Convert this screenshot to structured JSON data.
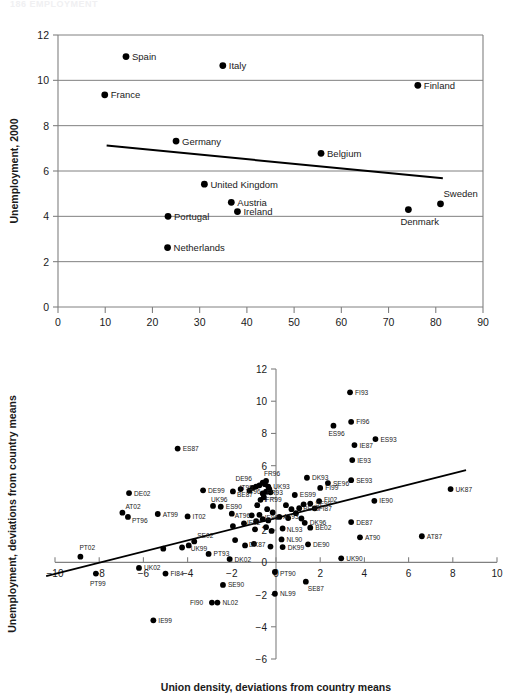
{
  "page": {
    "header_text": "186   EMPLOYMENT"
  },
  "chart_data": [
    {
      "id": "top",
      "type": "scatter",
      "title": "",
      "xlabel": "Union density, 2000",
      "ylabel": "Unemployment, 2000",
      "xlim": [
        0,
        90
      ],
      "ylim": [
        0,
        12
      ],
      "xticks": [
        0,
        10,
        20,
        30,
        40,
        50,
        60,
        70,
        80,
        90
      ],
      "yticks": [
        0,
        2,
        4,
        6,
        8,
        10,
        12
      ],
      "grid": "horizontal",
      "legend": "none",
      "trendline": {
        "x1": 10.3,
        "y1": 7.12,
        "x2": 81.5,
        "y2": 5.68
      },
      "points": [
        {
          "label": "Spain",
          "x": 14.4,
          "y": 11.05,
          "lx": 6,
          "ly": 3.5
        },
        {
          "label": "Italy",
          "x": 34.9,
          "y": 10.65,
          "lx": 6,
          "ly": 3.5
        },
        {
          "label": "Finland",
          "x": 76.2,
          "y": 9.78,
          "lx": 6,
          "ly": 3.5
        },
        {
          "label": "France",
          "x": 9.9,
          "y": 9.36,
          "lx": 6,
          "ly": 3.5
        },
        {
          "label": "Germany",
          "x": 25.0,
          "y": 7.32,
          "lx": 6,
          "ly": 3.5
        },
        {
          "label": "Belgium",
          "x": 55.7,
          "y": 6.78,
          "lx": 6,
          "ly": 3.5
        },
        {
          "label": "United Kingdom",
          "x": 31.0,
          "y": 5.42,
          "lx": 6,
          "ly": 3.5
        },
        {
          "label": "Austria",
          "x": 36.7,
          "y": 4.62,
          "lx": 6,
          "ly": 3.5
        },
        {
          "label": "Sweden",
          "x": 81.0,
          "y": 4.55,
          "lx": 3,
          "ly": -7
        },
        {
          "label": "Ireland",
          "x": 38.0,
          "y": 4.21,
          "lx": 6,
          "ly": 3.5
        },
        {
          "label": "Denmark",
          "x": 74.2,
          "y": 4.3,
          "lx": -8,
          "ly": 15
        },
        {
          "label": "Portugal",
          "x": 23.3,
          "y": 4.0,
          "lx": 6,
          "ly": 3.5
        },
        {
          "label": "Netherlands",
          "x": 23.2,
          "y": 2.62,
          "lx": 6,
          "ly": 3.5
        }
      ]
    },
    {
      "id": "bottom",
      "type": "scatter",
      "title": "",
      "xlabel": "Union density, deviations from country means",
      "ylabel": "Unemployment, deviations from country means",
      "xlim": [
        -10,
        10
      ],
      "ylim": [
        -6,
        12
      ],
      "xticks": [
        -10,
        -8,
        -6,
        -4,
        -2,
        0,
        2,
        4,
        6,
        8,
        10
      ],
      "yticks": [
        -6,
        -4,
        -2,
        0,
        2,
        4,
        6,
        8,
        10,
        12
      ],
      "grid": "none",
      "legend": "none",
      "trendline": {
        "x1": -10.4,
        "y1": -0.85,
        "x2": 8.6,
        "y2": 5.72
      },
      "points": [
        {
          "label": "FI93",
          "x": 3.35,
          "y": 10.55,
          "lx": 5,
          "ly": 2.5
        },
        {
          "label": "FI96",
          "x": 3.4,
          "y": 8.72,
          "lx": 5,
          "ly": 2.5
        },
        {
          "label": "ES96",
          "x": 2.6,
          "y": 8.48,
          "lx": -5,
          "ly": 10
        },
        {
          "label": "ES93",
          "x": 4.5,
          "y": 7.65,
          "lx": 5,
          "ly": 2.5
        },
        {
          "label": "IE87",
          "x": 3.55,
          "y": 7.28,
          "lx": 5,
          "ly": 2.5
        },
        {
          "label": "ES87",
          "x": -4.45,
          "y": 7.06,
          "lx": 5,
          "ly": 2.5
        },
        {
          "label": "IE93",
          "x": 3.45,
          "y": 6.35,
          "lx": 5,
          "ly": 2.5
        },
        {
          "label": "DK93",
          "x": 1.4,
          "y": 5.25,
          "lx": 5,
          "ly": 2.5
        },
        {
          "label": "SE93",
          "x": 3.4,
          "y": 5.1,
          "lx": 5,
          "ly": 2.5
        },
        {
          "label": "SE96",
          "x": 2.35,
          "y": 4.92,
          "lx": 5,
          "ly": 2.5
        },
        {
          "label": "FR96",
          "x": -0.45,
          "y": 5.05,
          "lx": -2,
          "ly": -5
        },
        {
          "label": "DE96",
          "x": -0.75,
          "y": 4.78,
          "lx": -24,
          "ly": -4
        },
        {
          "label": "UK93",
          "x": -0.35,
          "y": 4.7,
          "lx": 5,
          "ly": 2.5
        },
        {
          "label": "FI99",
          "x": 2.0,
          "y": 4.62,
          "lx": 5,
          "ly": 2.5
        },
        {
          "label": "UK87",
          "x": 7.9,
          "y": 4.55,
          "lx": 5,
          "ly": 2.5
        },
        {
          "label": "IT99",
          "x": -1.6,
          "y": 4.55,
          "lx": -1,
          "ly": 1
        },
        {
          "label": "IT96",
          "x": -1.2,
          "y": 4.45,
          "lx": -2,
          "ly": 3
        },
        {
          "label": "DE99",
          "x": -3.3,
          "y": 4.47,
          "lx": 5,
          "ly": 2.5
        },
        {
          "label": "BE87",
          "x": -1.95,
          "y": 4.4,
          "lx": 4,
          "ly": 6
        },
        {
          "label": "FR93",
          "x": -0.6,
          "y": 4.28,
          "lx": 4,
          "ly": 2
        },
        {
          "label": "DE02",
          "x": -6.65,
          "y": 4.3,
          "lx": 5,
          "ly": 2.5
        },
        {
          "label": "ES99",
          "x": 0.85,
          "y": 4.18,
          "lx": 5,
          "ly": 2.5
        },
        {
          "label": "IE90",
          "x": 4.45,
          "y": 3.82,
          "lx": 5,
          "ly": 2.5
        },
        {
          "label": "FR99",
          "x": -0.7,
          "y": 3.88,
          "lx": 5,
          "ly": 2.5
        },
        {
          "label": "SE99",
          "x": 1.55,
          "y": 3.65,
          "lx": 5,
          "ly": 2.5
        },
        {
          "label": "FI02",
          "x": 1.95,
          "y": 3.8,
          "lx": 5,
          "ly": 1
        },
        {
          "label": "BE99",
          "x": 1.05,
          "y": 3.36,
          "lx": 4,
          "ly": 3
        },
        {
          "label": "FI87",
          "x": 1.75,
          "y": 3.35,
          "lx": 4,
          "ly": 3
        },
        {
          "label": "ES90",
          "x": -2.5,
          "y": 3.45,
          "lx": 5,
          "ly": 2.5
        },
        {
          "label": "UK96",
          "x": -2.85,
          "y": 3.5,
          "lx": -2,
          "ly": -4
        },
        {
          "label": "AT96",
          "x": -2.0,
          "y": 3.02,
          "lx": 3,
          "ly": 4
        },
        {
          "label": "AT02",
          "x": -6.95,
          "y": 3.08,
          "lx": 3,
          "ly": -4
        },
        {
          "label": "AT99",
          "x": -5.35,
          "y": 3.0,
          "lx": 5,
          "ly": 2.5
        },
        {
          "label": "PT96",
          "x": -6.7,
          "y": 2.82,
          "lx": 4,
          "ly": 6
        },
        {
          "label": "IT02",
          "x": -4.0,
          "y": 2.85,
          "lx": 5,
          "ly": 2.5
        },
        {
          "label": "AT93",
          "x": 0.15,
          "y": 2.82,
          "lx": 4,
          "ly": 2
        },
        {
          "label": "IE96",
          "x": -0.6,
          "y": 2.68,
          "lx": 2,
          "ly": 1
        },
        {
          "label": "DE87",
          "x": 3.4,
          "y": 2.5,
          "lx": 5,
          "ly": 2.5
        },
        {
          "label": "DK96",
          "x": 1.3,
          "y": 2.45,
          "lx": 5,
          "ly": 2.5
        },
        {
          "label": "BE02",
          "x": 1.55,
          "y": 2.15,
          "lx": 5,
          "ly": 2.5
        },
        {
          "label": "NL93",
          "x": 0.3,
          "y": 2.1,
          "lx": 4,
          "ly": 3
        },
        {
          "label": "IE02",
          "x": -1.45,
          "y": 2.42,
          "lx": 3,
          "ly": 2
        },
        {
          "label": "AT90",
          "x": 3.8,
          "y": 1.55,
          "lx": 5,
          "ly": 2.5
        },
        {
          "label": "AT87",
          "x": 6.6,
          "y": 1.62,
          "lx": 5,
          "ly": 2.5
        },
        {
          "label": "NL90",
          "x": 0.25,
          "y": 1.42,
          "lx": 5,
          "ly": 2.5
        },
        {
          "label": "DE90",
          "x": 1.45,
          "y": 1.12,
          "lx": 5,
          "ly": 2.5
        },
        {
          "label": "DK99",
          "x": 0.3,
          "y": 0.95,
          "lx": 5,
          "ly": 2.5
        },
        {
          "label": "DK87",
          "x": -1.4,
          "y": 1.05,
          "lx": 4,
          "ly": 2
        },
        {
          "label": "SE02",
          "x": -3.7,
          "y": 1.3,
          "lx": 3,
          "ly": -3
        },
        {
          "label": "UK99",
          "x": -3.95,
          "y": 1.05,
          "lx": 2,
          "ly": 6
        },
        {
          "label": "PT02",
          "x": -8.85,
          "y": 0.35,
          "lx": -1,
          "ly": -7
        },
        {
          "label": "PT93",
          "x": -3.05,
          "y": 0.52,
          "lx": 5,
          "ly": 2.5
        },
        {
          "label": "UK90",
          "x": 2.95,
          "y": 0.25,
          "lx": 5,
          "ly": 2.5
        },
        {
          "label": "DK02",
          "x": -2.1,
          "y": 0.2,
          "lx": 5,
          "ly": 2.5
        },
        {
          "label": "UK02",
          "x": -6.2,
          "y": -0.35,
          "lx": 5,
          "ly": 2.5
        },
        {
          "label": "PT99",
          "x": -8.15,
          "y": -0.7,
          "lx": -6,
          "ly": 12
        },
        {
          "label": "FI84",
          "x": -5.0,
          "y": -0.7,
          "lx": 5,
          "ly": 2.5
        },
        {
          "label": "PT90",
          "x": -0.05,
          "y": -0.6,
          "lx": 5,
          "ly": 4
        },
        {
          "label": "SE87",
          "x": 1.35,
          "y": -1.2,
          "lx": 2,
          "ly": 9
        },
        {
          "label": "SE90",
          "x": -2.4,
          "y": -1.4,
          "lx": 5,
          "ly": 2.5
        },
        {
          "label": "NL99",
          "x": -0.05,
          "y": -1.95,
          "lx": 5,
          "ly": 2.5
        },
        {
          "label": "NL02",
          "x": -2.65,
          "y": -2.5,
          "lx": 5,
          "ly": 2.5
        },
        {
          "label": "FI90",
          "x": -2.9,
          "y": -2.5,
          "lx": -22,
          "ly": 2.5
        },
        {
          "label": "IE99",
          "x": -5.55,
          "y": -3.6,
          "lx": 5,
          "ly": 2.5
        }
      ],
      "unlabeled_points": [
        {
          "x": -0.6,
          "y": 4.95
        },
        {
          "x": -0.5,
          "y": 4.85
        },
        {
          "x": -0.9,
          "y": 4.7
        },
        {
          "x": -1.05,
          "y": 4.62
        },
        {
          "x": -0.3,
          "y": 4.55
        },
        {
          "x": -0.45,
          "y": 4.38
        },
        {
          "x": -0.25,
          "y": 4.35
        },
        {
          "x": -0.55,
          "y": 4.05
        },
        {
          "x": -0.85,
          "y": 3.55
        },
        {
          "x": -0.4,
          "y": 3.3
        },
        {
          "x": 0.45,
          "y": 3.55
        },
        {
          "x": 0.7,
          "y": 3.3
        },
        {
          "x": 1.25,
          "y": 3.6
        },
        {
          "x": 0.9,
          "y": 3.05
        },
        {
          "x": -0.15,
          "y": 3.1
        },
        {
          "x": -0.75,
          "y": 2.95
        },
        {
          "x": -1.1,
          "y": 2.92
        },
        {
          "x": -0.35,
          "y": 2.6
        },
        {
          "x": -0.9,
          "y": 2.55
        },
        {
          "x": -1.95,
          "y": 2.25
        },
        {
          "x": -0.45,
          "y": 2.18
        },
        {
          "x": -0.95,
          "y": 2.05
        },
        {
          "x": -0.2,
          "y": 1.95
        },
        {
          "x": -1.85,
          "y": 1.38
        },
        {
          "x": -1.0,
          "y": 1.15
        },
        {
          "x": -0.25,
          "y": 0.98
        },
        {
          "x": -4.25,
          "y": 0.92
        },
        {
          "x": -5.1,
          "y": 0.85
        },
        {
          "x": 0.55,
          "y": 2.75
        },
        {
          "x": 1.15,
          "y": 2.72
        }
      ]
    }
  ]
}
